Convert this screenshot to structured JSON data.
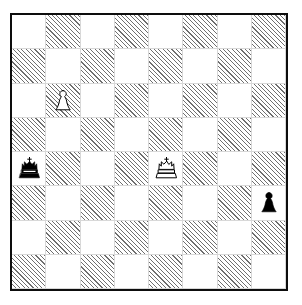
{
  "diagram": {
    "type": "chess-board-diagram",
    "orientation": "white-bottom",
    "files": [
      "a",
      "b",
      "c",
      "d",
      "e",
      "f",
      "g",
      "h"
    ],
    "ranks": [
      "8",
      "7",
      "6",
      "5",
      "4",
      "3",
      "2",
      "1"
    ],
    "square_colors": {
      "light": "#ffffff",
      "dark_hatch_line": "#6f6f6f",
      "dark_hatch_background": "#ffffff",
      "border": "#0d0d0d",
      "grid_line": "#d8d8d8"
    },
    "light_square_top_left": true,
    "coordinates_shown": false,
    "border_px": 2,
    "pieces": [
      {
        "square": "b6",
        "color": "white",
        "type": "pawn",
        "glyph": "white-pawn-icon",
        "row": 2,
        "col": 1
      },
      {
        "square": "a4",
        "color": "black",
        "type": "king",
        "glyph": "black-king-icon",
        "row": 4,
        "col": 0
      },
      {
        "square": "e4",
        "color": "white",
        "type": "king",
        "glyph": "white-king-icon",
        "row": 4,
        "col": 4
      },
      {
        "square": "h3",
        "color": "black",
        "type": "pawn",
        "glyph": "black-pawn-icon",
        "row": 5,
        "col": 7
      }
    ],
    "fen": "8/8/1P6/8/k3K3/7p/8/8 w - - 0 1",
    "material": {
      "white": "King, Pawn",
      "black": "King, Pawn"
    }
  }
}
